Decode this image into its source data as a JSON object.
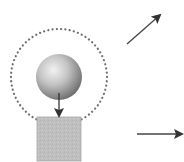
{
  "diagram": {
    "colors": {
      "background": "#ffffff",
      "orbit_dots": "#6e6e6e",
      "sphere_light": "#f2f2f2",
      "sphere_mid": "#b5b5b5",
      "sphere_dark": "#6a6a6a",
      "block_fill": "#bdbdbd",
      "block_edge": "#a8a8a8",
      "arrow": "#333333"
    },
    "orbit": {
      "cx": 59,
      "cy": 77,
      "r": 48,
      "style": "dotted"
    },
    "sphere": {
      "cx": 59,
      "cy": 77,
      "r": 23
    },
    "block": {
      "x": 37,
      "y": 117,
      "width": 44,
      "height": 44
    },
    "arrows": [
      {
        "name": "force-down-arrow",
        "x1": 59,
        "y1": 93,
        "x2": 59,
        "y2": 116
      },
      {
        "name": "diagonal-velocity-arrow",
        "x1": 127,
        "y1": 44,
        "x2": 160,
        "y2": 15
      },
      {
        "name": "horizontal-velocity-arrow",
        "x1": 137,
        "y1": 134,
        "x2": 182,
        "y2": 134
      }
    ]
  }
}
